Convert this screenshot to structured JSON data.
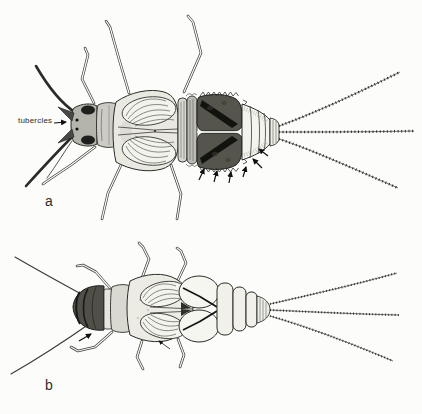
{
  "figure": {
    "background_color": "#fcfcfa",
    "ink_color": "#2b2b28"
  },
  "labels": {
    "tubercles": "tubercles",
    "panel_a": "a",
    "panel_b": "b"
  },
  "icons": {
    "tubercles_pointer": "arrow-right-icon",
    "gill_margin_pointers": "small-black-arrow-icons",
    "head_pointer_b": "small-black-arrow-icon",
    "wing_pad_pointer_b": "thin-arrow-icon"
  }
}
